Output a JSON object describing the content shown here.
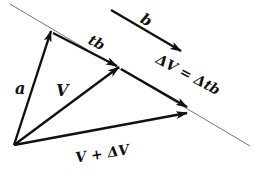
{
  "diagram": {
    "title": "",
    "colors": {
      "ink": "#111111",
      "guide_line": "#777777",
      "background": "#ffffff"
    },
    "origin": {
      "x": 14,
      "y": 145
    },
    "guide_line": {
      "x1": 10,
      "y1": 4,
      "x2": 250,
      "y2": 146
    },
    "vectors": [
      {
        "id": "a",
        "label": "a",
        "from": [
          14,
          145
        ],
        "to": [
          51,
          31
        ]
      },
      {
        "id": "V",
        "label": "V",
        "from": [
          14,
          145
        ],
        "to": [
          119,
          67
        ]
      },
      {
        "id": "V_plus_dV",
        "label": "V + ΔV",
        "from": [
          14,
          145
        ],
        "to": [
          187,
          113
        ]
      },
      {
        "id": "tb",
        "label": "tb",
        "from": [
          51,
          31
        ],
        "to": [
          119,
          67
        ]
      },
      {
        "id": "dV",
        "label": "ΔV = Δtb",
        "from": [
          119,
          67
        ],
        "to": [
          187,
          107
        ]
      },
      {
        "id": "b",
        "label": "b",
        "from": [
          111,
          10
        ],
        "to": [
          181,
          51
        ]
      }
    ],
    "labels": {
      "a": "a",
      "V": "V",
      "V_plus_dV": "V + ΔV",
      "tb": "tb",
      "dV_eq": "ΔV = Δtb",
      "b": "b"
    }
  }
}
